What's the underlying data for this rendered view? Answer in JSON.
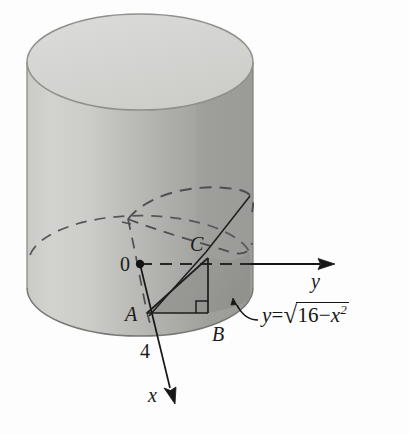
{
  "figure": {
    "axes": {
      "x_label": "x",
      "y_label": "y",
      "origin_label": "0"
    },
    "points": [
      {
        "id": "A",
        "label": "A"
      },
      {
        "id": "B",
        "label": "B"
      },
      {
        "id": "C",
        "label": "C"
      }
    ],
    "measurements": [
      {
        "id": "radius",
        "label": "4"
      }
    ],
    "annotation": {
      "variable": "y",
      "equals": "=",
      "radical_sign": "√",
      "radicand_constant": "16",
      "minus": "−",
      "radicand_variable": "x",
      "exponent": "2",
      "full_text": "y = √(16 − x²)"
    },
    "colors": {
      "top_face": "#d6d6d3",
      "body_light": "#cfcfcc",
      "body_mid": "#b9b9b5",
      "body_dark": "#a2a29e",
      "wedge_fill": "#9b9b97",
      "wedge_fill_dark": "#8d8d89",
      "outline": "#6d6d69",
      "stroke_dark": "#1d1d1d",
      "background": "#fdfdfd"
    }
  }
}
